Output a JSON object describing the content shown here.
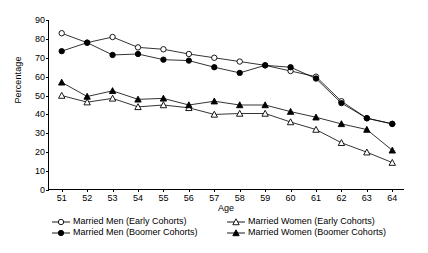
{
  "chart_data": {
    "type": "line",
    "title": "",
    "xlabel": "Age",
    "ylabel": "Percentage",
    "x": [
      51,
      52,
      53,
      54,
      55,
      56,
      57,
      58,
      59,
      60,
      61,
      62,
      63,
      64
    ],
    "xlim": [
      50.5,
      64.5
    ],
    "ylim": [
      0,
      90
    ],
    "yticks": [
      0,
      10,
      20,
      30,
      40,
      50,
      60,
      70,
      80,
      90
    ],
    "grid": false,
    "legend_position": "bottom",
    "series": [
      {
        "name": "Married Men (Early Cohorts)",
        "marker": "open-circle",
        "values": [
          83,
          78,
          81,
          75.5,
          74.5,
          72,
          70,
          68,
          66,
          63,
          60,
          47,
          38,
          35
        ]
      },
      {
        "name": "Married Men (Boomer Cohorts)",
        "marker": "filled-circle",
        "values": [
          73.5,
          78,
          71.5,
          72,
          69,
          68.5,
          65,
          62,
          66,
          65,
          59,
          46,
          38,
          35
        ]
      },
      {
        "name": "Married Women (Early Cohorts)",
        "marker": "open-triangle",
        "values": [
          50,
          46.5,
          48.5,
          44,
          45,
          43.5,
          40,
          40.5,
          40.5,
          36,
          32,
          25,
          20,
          14.5
        ]
      },
      {
        "name": "Married Women (Boomer Cohorts)",
        "marker": "filled-triangle",
        "values": [
          57,
          49.5,
          52.5,
          48,
          48.5,
          45,
          47,
          45,
          45,
          41.5,
          38.5,
          35,
          32,
          21
        ]
      }
    ]
  },
  "legend": {
    "items": [
      {
        "label": "Married Men (Early Cohorts)",
        "marker": "open-circle"
      },
      {
        "label": "Married Women (Early Cohorts)",
        "marker": "open-triangle"
      },
      {
        "label": "Married Men (Boomer Cohorts)",
        "marker": "filled-circle"
      },
      {
        "label": "Married Women (Boomer Cohorts)",
        "marker": "filled-triangle"
      }
    ]
  },
  "colors": {
    "line": "#000000",
    "marker_fill_open": "#ffffff",
    "marker_fill_solid": "#000000",
    "axis": "#000000",
    "background": "#ffffff"
  }
}
